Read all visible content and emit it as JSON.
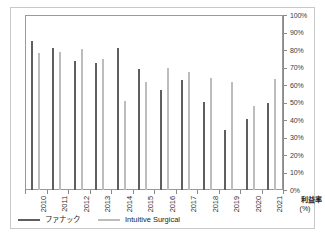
{
  "chart_data": {
    "type": "bar",
    "title": "",
    "subtitle": "",
    "xlabel": "",
    "ylabel": "利益率\n(%)",
    "ylabel_main": "利益率",
    "ylabel_unit": "(%)",
    "ylim": [
      0,
      100
    ],
    "ytick_labels": [
      "100%",
      "90%",
      "80%",
      "70%",
      "60%",
      "50%",
      "40%",
      "30%",
      "20%",
      "10%",
      "0%"
    ],
    "ytick_values": [
      100,
      90,
      80,
      70,
      60,
      50,
      40,
      30,
      20,
      10,
      0
    ],
    "grid": false,
    "legend_position": "bottom-left",
    "yaxis_position": "right",
    "categories": [
      "2010",
      "2011",
      "2012",
      "2013",
      "2014",
      "2015",
      "2016",
      "2017",
      "2018",
      "2019",
      "2020",
      "2021"
    ],
    "series": [
      {
        "name": "ファナック",
        "color": "#5f5f5f",
        "values": [
          85,
          81,
          74,
          72.5,
          81,
          69,
          57,
          63,
          50.5,
          34.5,
          40.5,
          49.5
        ]
      },
      {
        "name": "Intuitive Surgical",
        "color": "#bdbdbd",
        "values": [
          78.5,
          79,
          80.5,
          75,
          51,
          62,
          70,
          67.5,
          64,
          62,
          48,
          63.5
        ]
      }
    ]
  },
  "legend": {
    "items": [
      {
        "label": "ファナック",
        "color": "#5f5f5f"
      },
      {
        "label": "Intuitive Surgical",
        "color": "#bdbdbd"
      }
    ]
  },
  "colors": {
    "series_a": "#5f5f5f",
    "series_b": "#bdbdbd",
    "axis": "#8a8a8a",
    "frame": "#c9c9c9",
    "background": "#ffffff",
    "text": "#1d1d1d"
  }
}
